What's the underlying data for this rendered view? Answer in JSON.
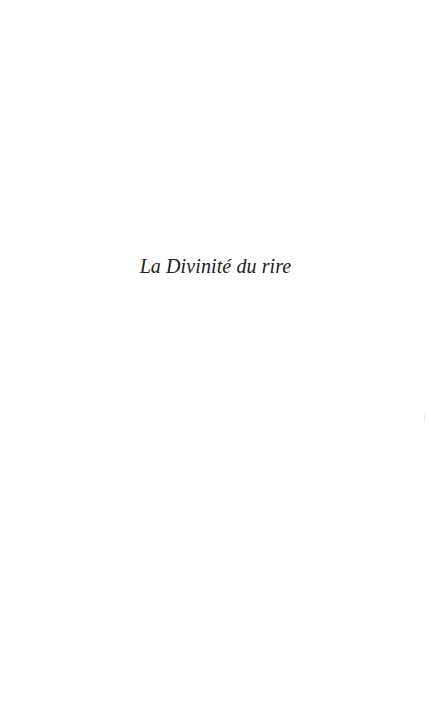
{
  "page": {
    "half_title": "La Divinité du rire",
    "colors": {
      "background": "#ffffff",
      "text": "#222222"
    }
  }
}
